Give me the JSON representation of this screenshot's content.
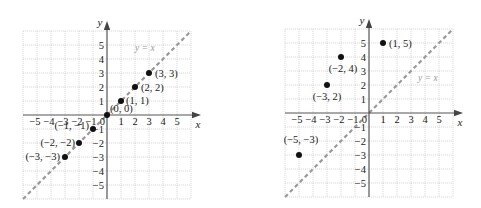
{
  "chart_data": [
    {
      "type": "scatter",
      "title": "",
      "xlabel": "x",
      "ylabel": "y",
      "xlim": [
        -6,
        6
      ],
      "ylim": [
        -6,
        6
      ],
      "grid": true,
      "x_ticks": [
        -5,
        -4,
        -3,
        -2,
        -1,
        1,
        2,
        3,
        4,
        5
      ],
      "y_ticks": [
        5,
        4,
        3,
        2,
        1,
        -1,
        -2,
        -3,
        -4,
        -5
      ],
      "origin_label": "0",
      "reference_line": {
        "label": "y = x",
        "slope": 1,
        "intercept": 0,
        "style": "dashed",
        "color": "#9a9a9a"
      },
      "points": [
        {
          "x": 3,
          "y": 3,
          "label": "(3, 3)"
        },
        {
          "x": 2,
          "y": 2,
          "label": "(2, 2)"
        },
        {
          "x": 1,
          "y": 1,
          "label": "(1, 1)"
        },
        {
          "x": 0,
          "y": 0,
          "label": "(0, 0)"
        },
        {
          "x": -1,
          "y": -1,
          "label": "(−1, −1)"
        },
        {
          "x": -2,
          "y": -2,
          "label": "(−2, −2)"
        },
        {
          "x": -3,
          "y": -3,
          "label": "(−3, −3)"
        }
      ]
    },
    {
      "type": "scatter",
      "title": "",
      "xlabel": "x",
      "ylabel": "y",
      "xlim": [
        -6,
        6
      ],
      "ylim": [
        -6,
        6
      ],
      "grid": true,
      "x_ticks": [
        -5,
        -4,
        -3,
        -2,
        -1,
        1,
        2,
        3,
        4,
        5
      ],
      "y_ticks": [
        5,
        4,
        3,
        2,
        1,
        -1,
        -2,
        -3,
        -4,
        -5
      ],
      "origin_label": "0",
      "reference_line": {
        "label": "y = x",
        "slope": 1,
        "intercept": 0,
        "style": "dashed",
        "color": "#9a9a9a"
      },
      "points": [
        {
          "x": 1,
          "y": 5,
          "label": "(1, 5)"
        },
        {
          "x": -2,
          "y": 4,
          "label": "(−2, 4)"
        },
        {
          "x": -3,
          "y": 2,
          "label": "(−3, 2)"
        },
        {
          "x": -5,
          "y": -3,
          "label": "(−5, −3)"
        }
      ]
    }
  ]
}
